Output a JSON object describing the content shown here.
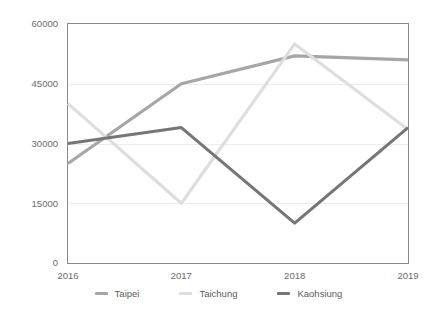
{
  "chart_data": {
    "type": "line",
    "title": "",
    "subtitle": "",
    "xlabel": "",
    "ylabel": "",
    "categories": [
      "2016",
      "2017",
      "2018",
      "2019"
    ],
    "x": [
      2016,
      2017,
      2018,
      2019
    ],
    "ylim": [
      0,
      60000
    ],
    "xlim": [
      2016,
      2019
    ],
    "yticks": [
      0,
      15000,
      30000,
      45000,
      60000
    ],
    "ytick_labels": [
      "0",
      "15000",
      "30000",
      "45000",
      "60000"
    ],
    "xtick_labels": [
      "2016",
      "2017",
      "2018",
      "2019"
    ],
    "grid": "horizontal",
    "legend_position": "bottom-center",
    "series": [
      {
        "name": "Taipei",
        "color": "#a6a6a6",
        "values": [
          25000,
          45000,
          52000,
          51000
        ]
      },
      {
        "name": "Taichung",
        "color": "#dedede",
        "values": [
          40000,
          15000,
          55000,
          33500
        ]
      },
      {
        "name": "Kaohsiung",
        "color": "#767676",
        "values": [
          30000,
          34000,
          10000,
          34000
        ]
      }
    ]
  },
  "axes": {
    "y_ticks": [
      {
        "label": "60000",
        "value": 60000
      },
      {
        "label": "45000",
        "value": 45000
      },
      {
        "label": "30000",
        "value": 30000
      },
      {
        "label": "15000",
        "value": 15000
      },
      {
        "label": "0",
        "value": 0
      }
    ],
    "x_ticks": [
      {
        "label": "2016",
        "value": 2016
      },
      {
        "label": "2017",
        "value": 2017
      },
      {
        "label": "2018",
        "value": 2018
      },
      {
        "label": "2019",
        "value": 2019
      }
    ]
  },
  "legend": {
    "items": [
      {
        "label": "Taipei",
        "color": "#a6a6a6"
      },
      {
        "label": "Taichung",
        "color": "#dedede"
      },
      {
        "label": "Kaohsiung",
        "color": "#767676"
      }
    ]
  },
  "style": {
    "background": "#ffffff",
    "grid_color": "#ececec",
    "border_color": "#8a8a8a",
    "text_color": "#6b6b6b"
  }
}
